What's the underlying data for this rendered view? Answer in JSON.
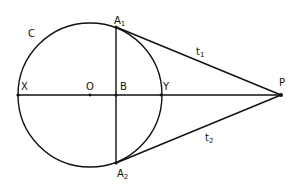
{
  "diagram": {
    "type": "geometry",
    "circle": {
      "label": "C",
      "center_label": "O",
      "cx": 90,
      "cy": 95,
      "r": 72
    },
    "points": {
      "X": {
        "label": "X",
        "x": 18,
        "y": 95
      },
      "O": {
        "label": "O",
        "x": 90,
        "y": 95
      },
      "B": {
        "label": "B",
        "x": 116,
        "y": 95
      },
      "Y": {
        "label": "Y",
        "x": 161,
        "y": 95
      },
      "P": {
        "label": "P",
        "x": 281,
        "y": 95
      },
      "A1": {
        "label": "A",
        "sub": "1",
        "x": 116,
        "y": 27
      },
      "A2": {
        "label": "A",
        "sub": "2",
        "x": 116,
        "y": 163
      }
    },
    "tangents": {
      "t1": {
        "label": "t",
        "sub": "1"
      },
      "t2": {
        "label": "t",
        "sub": "2"
      }
    },
    "colors": {
      "ink": "#111111",
      "background": "#ffffff"
    }
  }
}
